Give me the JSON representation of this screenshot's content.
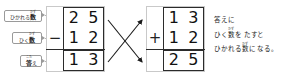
{
  "diagram": {
    "labels": [
      {
        "id": "minuend",
        "ruby": "かず",
        "base": "数",
        "prefix": "ひかれる",
        "full": "ひかれる数"
      },
      {
        "id": "subtrahend",
        "ruby": "かず",
        "base": "数",
        "prefix": "ひく",
        "full": "ひく数"
      },
      {
        "id": "answer",
        "ruby": "こた",
        "base": "答",
        "prefix": "",
        "suffix": "え",
        "full": "答え"
      }
    ],
    "left_calc": {
      "name": "subtraction",
      "operator": "−",
      "rows": [
        {
          "role": "minuend",
          "digits": [
            "2",
            "5"
          ]
        },
        {
          "role": "subtrahend",
          "digits": [
            "1",
            "2"
          ]
        },
        {
          "role": "answer",
          "digits": [
            "1",
            "3"
          ]
        }
      ]
    },
    "right_calc": {
      "name": "addition-check",
      "operator": "+",
      "rows": [
        {
          "role": "answer",
          "digits": [
            "1",
            "3"
          ]
        },
        {
          "role": "subtrahend",
          "digits": [
            "1",
            "2"
          ]
        },
        {
          "role": "sum",
          "digits": [
            "2",
            "5"
          ]
        }
      ]
    },
    "arrows": [
      {
        "id": "answer-to-top",
        "from": "left-answer",
        "to": "right-top"
      },
      {
        "id": "subtrahend-to-mid",
        "from": "left-subtrahend",
        "to": "right-middle"
      }
    ],
    "explanation": {
      "lines": [
        {
          "id": "line-1",
          "parts": [
            {
              "t": "答えに"
            }
          ]
        },
        {
          "id": "line-2",
          "parts": [
            {
              "t": "ひく"
            },
            {
              "ruby": "かず",
              "base": "数"
            },
            {
              "t": "を"
            },
            {
              "sp": true
            },
            {
              "t": "たすと"
            }
          ]
        },
        {
          "id": "line-3",
          "parts": [
            {
              "t": "ひかれる"
            },
            {
              "ruby": "かず",
              "base": "数"
            },
            {
              "t": "に"
            },
            {
              "sp": true
            },
            {
              "t": "なる。"
            }
          ]
        }
      ],
      "plain": "答えに ひく数を たすと ひかれる数に なる。"
    },
    "colors": {
      "grid_light": "#c9c9c9",
      "grid_heavy": "#2b2b2b",
      "text": "#111111",
      "callout_border": "#9a9a9a",
      "background": "#ffffff"
    }
  }
}
